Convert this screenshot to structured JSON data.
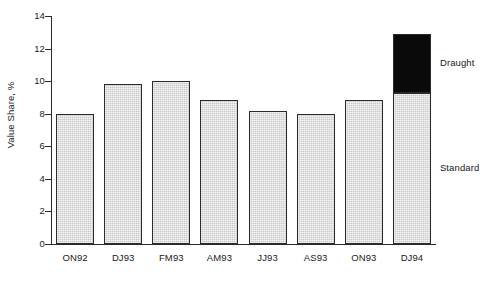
{
  "chart_data": {
    "type": "bar",
    "stacked": true,
    "title": "",
    "xlabel": "",
    "ylabel": "Value Share, %",
    "ylim": [
      0,
      14
    ],
    "yticks": [
      0,
      2,
      4,
      6,
      8,
      10,
      12,
      14
    ],
    "ytick_labels": [
      "0",
      "2",
      "4",
      "6",
      "8",
      "10",
      "12",
      "14"
    ],
    "grid": false,
    "legend_position": "right-inline-annotations",
    "categories": [
      "ON92",
      "DJ93",
      "FM93",
      "AM93",
      "JJ93",
      "AS93",
      "ON93",
      "DJ94"
    ],
    "series": [
      {
        "name": "Standard",
        "color": "#c9c9c9",
        "values": [
          8.0,
          9.85,
          10.0,
          8.85,
          8.15,
          8.0,
          8.85,
          9.3
        ]
      },
      {
        "name": "Draught",
        "color": "#0a0a0a",
        "values": [
          0,
          0,
          0,
          0,
          0,
          0,
          0,
          3.6
        ]
      }
    ],
    "totals": [
      8.0,
      9.85,
      10.0,
      8.85,
      8.15,
      8.0,
      8.85,
      12.9
    ],
    "annotations": [
      {
        "name": "Draught",
        "label": "Draught",
        "value_ref": 11.1
      },
      {
        "name": "Standard",
        "label": "Standard",
        "value_ref": 4.65
      }
    ]
  }
}
